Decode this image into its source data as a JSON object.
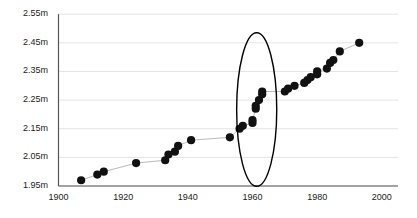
{
  "chart_data": {
    "type": "scatter",
    "title": "",
    "subtitle": "",
    "xlabel": "",
    "ylabel": "",
    "xlim": [
      1900,
      2005
    ],
    "ylim": [
      1.95,
      2.55
    ],
    "grid": true,
    "grid_axis": "y",
    "legend": null,
    "legend_position": "none",
    "connector_line": true,
    "marker": "filled-circle",
    "marker_color": "#111111",
    "line_color": "#bbbbbb",
    "axis_color": "#555555",
    "grid_color": "#e4e4e4",
    "background": "#ffffff",
    "y_ticks": [
      1.95,
      2.05,
      2.15,
      2.25,
      2.35,
      2.45,
      2.55
    ],
    "y_tick_labels": [
      "1.95m",
      "2.05m",
      "2.15m",
      "2.25m",
      "2.35m",
      "2.45m",
      "2.55m"
    ],
    "x_ticks": [
      1900,
      1920,
      1940,
      1960,
      1980,
      2000
    ],
    "x_tick_labels": [
      "1900",
      "1920",
      "1940",
      "1960",
      "1980",
      "2000"
    ],
    "series": [
      {
        "name": "record progression",
        "x": [
          1907,
          1912,
          1914,
          1924,
          1933,
          1934,
          1936,
          1937,
          1941,
          1953,
          1956,
          1957,
          1960,
          1960,
          1961,
          1961,
          1962,
          1963,
          1963,
          1970,
          1971,
          1973,
          1976,
          1977,
          1978,
          1980,
          1980,
          1983,
          1984,
          1985,
          1987,
          1993
        ],
        "y": [
          1.97,
          1.99,
          2.0,
          2.03,
          2.04,
          2.06,
          2.07,
          2.09,
          2.11,
          2.12,
          2.15,
          2.16,
          2.17,
          2.18,
          2.22,
          2.23,
          2.25,
          2.27,
          2.28,
          2.28,
          2.29,
          2.3,
          2.31,
          2.32,
          2.33,
          2.34,
          2.35,
          2.36,
          2.38,
          2.39,
          2.42,
          2.45
        ]
      }
    ],
    "annotations": [
      {
        "type": "ellipse",
        "name": "highlight-ellipse",
        "center_x": 1961.3,
        "center_y": 2.217,
        "width_x": 6.2,
        "height_y": 0.268,
        "stroke": "#000000",
        "stroke_width": 1.4,
        "fill": "none",
        "label": ""
      }
    ]
  }
}
